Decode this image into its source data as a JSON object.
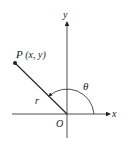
{
  "diagram": {
    "type": "polar-coordinates",
    "labels": {
      "point": "P",
      "point_coords": "(x, y)",
      "radius": "r",
      "angle": "θ",
      "origin": "O",
      "x_axis": "x",
      "y_axis": "y"
    },
    "colors": {
      "line": "#222222",
      "background": "#ffffff"
    }
  }
}
